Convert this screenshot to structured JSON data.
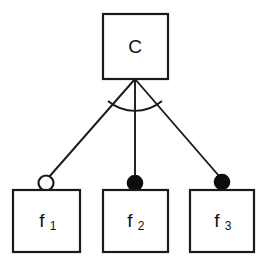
{
  "diagram": {
    "kind": "feature-model-diagram",
    "background_color": "#ffffff",
    "line_color": "#1a1a1a",
    "fill_color": "#ffffff",
    "filled_marker_color": "#0d0d0d",
    "width": 267,
    "height": 261,
    "root": {
      "id": "concept",
      "label": "C",
      "label_sub": "",
      "box": {
        "x": 103,
        "y": 14,
        "w": 65,
        "h": 65
      }
    },
    "children": [
      {
        "id": "feature-1",
        "label": "f",
        "label_sub": "1",
        "box": {
          "x": 13,
          "y": 190,
          "w": 67,
          "h": 62
        },
        "marker": {
          "type": "hollow-circle",
          "semantics": "optional",
          "cx": 46,
          "cy": 183,
          "r": 8
        },
        "edge": {
          "x1": 135,
          "y1": 79,
          "x2": 49,
          "y2": 177
        }
      },
      {
        "id": "feature-2",
        "label": "f",
        "label_sub": "2",
        "box": {
          "x": 103,
          "y": 190,
          "w": 65,
          "h": 62
        },
        "marker": {
          "type": "filled-circle",
          "semantics": "mandatory",
          "cx": 135,
          "cy": 183,
          "r": 8
        },
        "edge": {
          "x1": 135,
          "y1": 79,
          "x2": 135,
          "y2": 176
        }
      },
      {
        "id": "feature-3",
        "label": "f",
        "label_sub": "3",
        "box": {
          "x": 190,
          "y": 190,
          "w": 64,
          "h": 62
        },
        "marker": {
          "type": "filled-circle",
          "semantics": "mandatory",
          "cx": 222,
          "cy": 182,
          "r": 8
        },
        "edge": {
          "x1": 135,
          "y1": 79,
          "x2": 219,
          "y2": 176
        }
      }
    ],
    "group_arc": {
      "semantics": "or-group",
      "start_x": 103,
      "start_y": 108,
      "end_x": 169,
      "end_y": 108,
      "sweep_radius": 46,
      "apex_x": 135,
      "apex_y": 79
    }
  }
}
